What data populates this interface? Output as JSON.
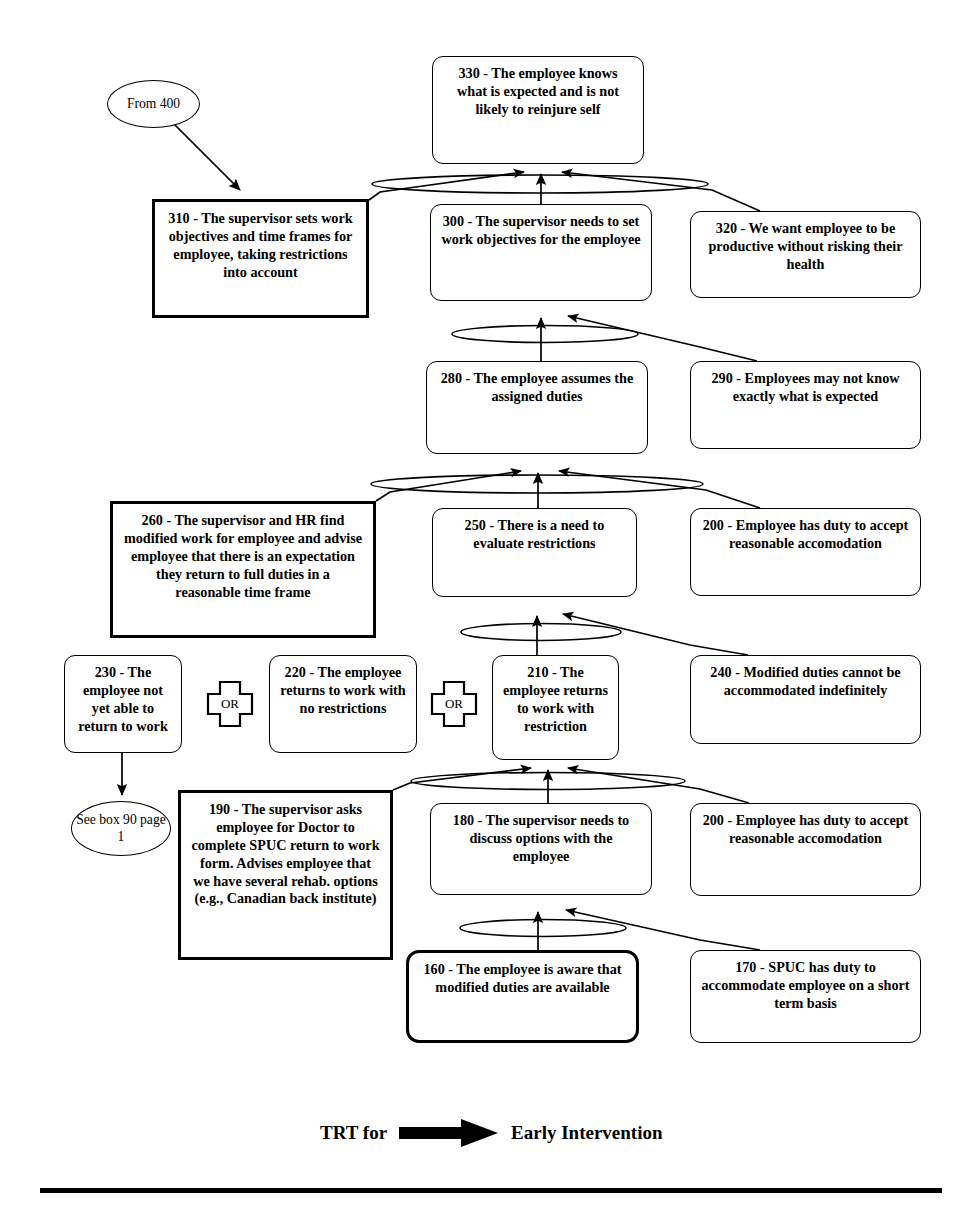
{
  "nodes": [
    {
      "id": "330",
      "label": "330 - The employee knows what is expected and is not likely to reinjure self",
      "shape": "rounded-box",
      "style": "thin",
      "x": 432,
      "y": 56,
      "w": 212,
      "h": 108,
      "font": 14.2
    },
    {
      "id": "310",
      "label": "310 - The supervisor sets work objectives and time frames for employee, taking restrictions into account",
      "shape": "box",
      "style": "thick",
      "x": 152,
      "y": 199,
      "w": 217,
      "h": 119,
      "font": 14.2
    },
    {
      "id": "300",
      "label": "300 - The supervisor needs to set work objectives for the employee",
      "shape": "rounded-box",
      "style": "thin",
      "x": 430,
      "y": 204,
      "w": 222,
      "h": 97,
      "font": 14.2
    },
    {
      "id": "320",
      "label": "320 - We want employee to be productive without risking their health",
      "shape": "rounded-box",
      "style": "thin",
      "x": 690,
      "y": 211,
      "w": 231,
      "h": 87,
      "font": 14.2
    },
    {
      "id": "280",
      "label": "280 - The employee assumes the assigned duties",
      "shape": "rounded-box",
      "style": "thin",
      "x": 426,
      "y": 361,
      "w": 222,
      "h": 93,
      "font": 14.2
    },
    {
      "id": "290",
      "label": "290 - Employees may not know exactly what is expected",
      "shape": "rounded-box",
      "style": "thin",
      "x": 690,
      "y": 361,
      "w": 231,
      "h": 88,
      "font": 14.2
    },
    {
      "id": "260",
      "label": "260 - The supervisor and HR find modified work for employee and advise employee that there is an expectation they return to full duties in a reasonable time frame",
      "shape": "box",
      "style": "thick",
      "x": 110,
      "y": 501,
      "w": 266,
      "h": 137,
      "font": 14.2
    },
    {
      "id": "250",
      "label": "250 - There is a need to evaluate restrictions",
      "shape": "rounded-box",
      "style": "thin",
      "x": 432,
      "y": 508,
      "w": 205,
      "h": 89,
      "font": 14.2
    },
    {
      "id": "200a",
      "label": "200 - Employee has duty to accept reasonable accomodation",
      "shape": "rounded-box",
      "style": "thin",
      "x": 690,
      "y": 508,
      "w": 231,
      "h": 88,
      "font": 14.2
    },
    {
      "id": "230",
      "label": "230 - The employee not yet able to return to work",
      "shape": "rounded-box",
      "style": "thin",
      "x": 64,
      "y": 655,
      "w": 118,
      "h": 98,
      "font": 14.2
    },
    {
      "id": "220",
      "label": "220 - The employee returns to work with no restrictions",
      "shape": "rounded-box",
      "style": "thin",
      "x": 269,
      "y": 655,
      "w": 148,
      "h": 98,
      "font": 14.2
    },
    {
      "id": "210",
      "label": "210 - The employee returns to work with restriction",
      "shape": "rounded-box",
      "style": "thin",
      "x": 492,
      "y": 655,
      "w": 127,
      "h": 105,
      "font": 14.2
    },
    {
      "id": "240",
      "label": "240 - Modified duties cannot be accommodated indefinitely",
      "shape": "rounded-box",
      "style": "thin",
      "x": 690,
      "y": 655,
      "w": 231,
      "h": 89,
      "font": 14.2
    },
    {
      "id": "190",
      "label": "190 - The supervisor asks employee for Doctor to complete SPUC return to work form. Advises employee that we have several rehab. options (e.g., Canadian back institute)",
      "shape": "box",
      "style": "thick",
      "x": 178,
      "y": 790,
      "w": 215,
      "h": 170,
      "font": 14.2
    },
    {
      "id": "180",
      "label": "180 - The supervisor needs to discuss options with the employee",
      "shape": "rounded-box",
      "style": "thin",
      "x": 430,
      "y": 803,
      "w": 222,
      "h": 92,
      "font": 14.2
    },
    {
      "id": "200b",
      "label": "200 - Employee has duty to accept reasonable accomodation",
      "shape": "rounded-box",
      "style": "thin",
      "x": 690,
      "y": 803,
      "w": 231,
      "h": 93,
      "font": 14.2
    },
    {
      "id": "160",
      "label": "160 - The employee is aware that modified duties are available",
      "shape": "rounded-box",
      "style": "thick-round",
      "x": 406,
      "y": 950,
      "w": 233,
      "h": 93,
      "font": 14.2
    },
    {
      "id": "170",
      "label": "170 - SPUC has duty to accommodate employee on a short term basis",
      "shape": "rounded-box",
      "style": "thin",
      "x": 690,
      "y": 950,
      "w": 231,
      "h": 93,
      "font": 14.2
    }
  ],
  "ellipses": [
    {
      "id": "from-400",
      "label": "From 400",
      "x": 107,
      "y": 80,
      "w": 93,
      "h": 48,
      "font": 13.6
    },
    {
      "id": "see-box-90",
      "label": "See box 90 page 1",
      "x": 71,
      "y": 801,
      "w": 100,
      "h": 55,
      "font": 13.6
    }
  ],
  "or_gates": [
    {
      "id": "or-1",
      "label": "OR",
      "x": 206,
      "y": 680,
      "w": 48,
      "h": 48
    },
    {
      "id": "or-2",
      "label": "OR",
      "x": 430,
      "y": 680,
      "w": 48,
      "h": 48
    }
  ],
  "footer": {
    "left_text": "TRT for",
    "right_text": "Early Intervention",
    "arrow_name": "black-right-arrow",
    "x": 320,
    "y": 1118,
    "font": 19
  },
  "rule": {
    "x": 40,
    "y": 1188,
    "w": 902,
    "h": 5
  },
  "colors": {
    "ink": "#000000",
    "paper": "#ffffff"
  },
  "connections": [
    {
      "from": "310",
      "to": "330",
      "kind": "arrow-into-and-junction"
    },
    {
      "from": "300",
      "to": "330",
      "kind": "arrow-into-and-junction"
    },
    {
      "from": "320",
      "to": "330",
      "kind": "arrow-into-and-junction"
    },
    {
      "from": "280",
      "to": "300",
      "kind": "arrow-into-and-junction"
    },
    {
      "from": "290",
      "to": "300",
      "kind": "arrow-into-and-junction"
    },
    {
      "from": "260",
      "to": "280",
      "kind": "arrow-into-and-junction"
    },
    {
      "from": "250",
      "to": "280",
      "kind": "arrow-into-and-junction"
    },
    {
      "from": "200a",
      "to": "280",
      "kind": "arrow-into-and-junction"
    },
    {
      "from": "210",
      "to": "250",
      "kind": "arrow-into-and-junction"
    },
    {
      "from": "240",
      "to": "250",
      "kind": "arrow-into-and-junction"
    },
    {
      "from": "190",
      "to": "210",
      "kind": "arrow-into-and-junction"
    },
    {
      "from": "180",
      "to": "210",
      "kind": "arrow-into-and-junction"
    },
    {
      "from": "200b",
      "to": "210",
      "kind": "arrow-into-and-junction"
    },
    {
      "from": "160",
      "to": "180",
      "kind": "arrow-into-and-junction"
    },
    {
      "from": "170",
      "to": "180",
      "kind": "arrow-into-and-junction"
    },
    {
      "from": "from-400",
      "to": "310",
      "kind": "plain-arrow"
    },
    {
      "from": "230",
      "to": "see-box-90",
      "kind": "plain-arrow"
    },
    {
      "from": "230",
      "to": "220",
      "kind": "or-gate"
    },
    {
      "from": "220",
      "to": "210",
      "kind": "or-gate"
    }
  ]
}
